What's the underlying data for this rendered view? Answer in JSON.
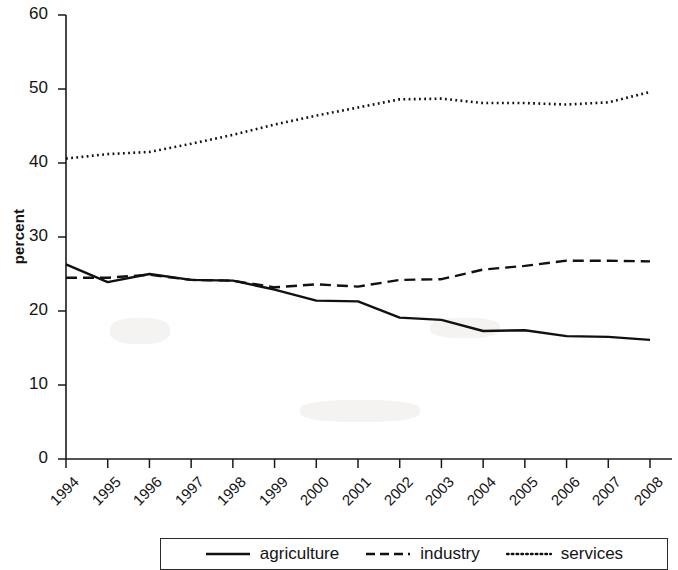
{
  "axes": {
    "ylabel": "percent",
    "yticks": [
      0,
      10,
      20,
      30,
      40,
      50,
      60
    ],
    "ylim": [
      0,
      60
    ],
    "xticks": [
      "1994",
      "1995",
      "1996",
      "1997",
      "1998",
      "1999",
      "2000",
      "2001",
      "2002",
      "2003",
      "2004",
      "2005",
      "2006",
      "2007",
      "2008"
    ]
  },
  "legend": {
    "items": [
      {
        "label": "agriculture",
        "style": "solid",
        "icon": "solid-line-icon"
      },
      {
        "label": "industry",
        "style": "dashed",
        "icon": "dashed-line-icon"
      },
      {
        "label": "services",
        "style": "dotted",
        "icon": "dotted-line-icon"
      }
    ]
  },
  "chart_data": {
    "type": "line",
    "title": "",
    "xlabel": "",
    "ylabel": "percent",
    "ylim": [
      0,
      60
    ],
    "yticks": [
      0,
      10,
      20,
      30,
      40,
      50,
      60
    ],
    "grid": false,
    "legend_position": "bottom",
    "categories": [
      "1994",
      "1995",
      "1996",
      "1997",
      "1998",
      "1999",
      "2000",
      "2001",
      "2002",
      "2003",
      "2004",
      "2005",
      "2006",
      "2007",
      "2008"
    ],
    "x": [
      1994,
      1995,
      1996,
      1997,
      1998,
      1999,
      2000,
      2001,
      2002,
      2003,
      2004,
      2005,
      2006,
      2007,
      2008
    ],
    "series": [
      {
        "name": "agriculture",
        "style": "solid",
        "color": "#111111",
        "values": [
          26.3,
          23.9,
          25.0,
          24.2,
          24.1,
          22.9,
          21.4,
          21.3,
          19.1,
          18.8,
          17.3,
          17.4,
          16.6,
          16.5,
          16.1
        ]
      },
      {
        "name": "industry",
        "style": "dashed",
        "color": "#111111",
        "values": [
          24.5,
          24.5,
          24.9,
          24.2,
          24.1,
          23.2,
          23.6,
          23.3,
          24.2,
          24.3,
          25.6,
          26.1,
          26.8,
          26.8,
          26.7
        ]
      },
      {
        "name": "services",
        "style": "dotted",
        "color": "#111111",
        "values": [
          40.6,
          41.2,
          41.5,
          42.6,
          43.8,
          45.2,
          46.4,
          47.5,
          48.6,
          48.7,
          48.1,
          48.1,
          47.9,
          48.2,
          49.6
        ]
      }
    ]
  }
}
